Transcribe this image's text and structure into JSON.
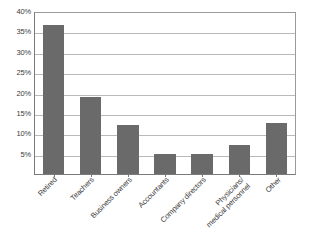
{
  "chart_data": {
    "type": "bar",
    "title": "",
    "subtitle": "",
    "xlabel": "",
    "ylabel": "",
    "categories": [
      "Retired",
      "Teachers",
      "Business owners",
      "Accountants",
      "Company directors",
      "Physicians/ medical personnel",
      "Other"
    ],
    "category_lines": [
      [
        "Retired"
      ],
      [
        "Teachers"
      ],
      [
        "Business owners"
      ],
      [
        "Accountants"
      ],
      [
        "Company directors"
      ],
      [
        "Physicians/",
        "medical personnel"
      ],
      [
        "Other"
      ]
    ],
    "values": [
      36.5,
      19,
      12,
      5,
      5,
      7,
      12.5
    ],
    "value_labels": [
      "36.5%",
      "19%",
      "12%",
      "5%",
      "5%",
      "7%",
      "12.5%"
    ],
    "ylim": [
      0,
      40
    ],
    "ytick_values": [
      5,
      10,
      15,
      20,
      25,
      30,
      35,
      40
    ],
    "ytick_labels": [
      "5%",
      "10%",
      "15%",
      "20%",
      "25%",
      "30%",
      "35%",
      "40%"
    ],
    "grid": "horizontal",
    "legend": "none",
    "bar_color": "#6a6a6a",
    "gridline_color": "#b9b9b9",
    "axis_color": "#7a7a7a",
    "plot_background": "#ffffff",
    "text_color": "#3c3c3c",
    "label_rotation": -45
  }
}
